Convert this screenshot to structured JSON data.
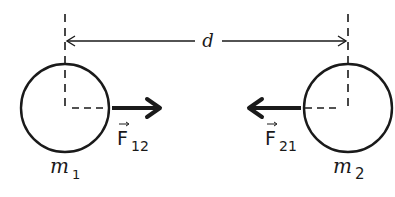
{
  "diagram": {
    "distance_label": "d",
    "masses": [
      {
        "name": "m",
        "subscript": "1",
        "side": "left"
      },
      {
        "name": "m",
        "subscript": "2",
        "side": "right"
      }
    ],
    "forces": [
      {
        "symbol": "F",
        "subscript": "12",
        "direction": "right",
        "vector_arrow": "→"
      },
      {
        "symbol": "F",
        "subscript": "21",
        "direction": "left",
        "vector_arrow": "→"
      }
    ],
    "colors": {
      "stroke": "#1a1a1a",
      "background": "#ffffff"
    }
  }
}
